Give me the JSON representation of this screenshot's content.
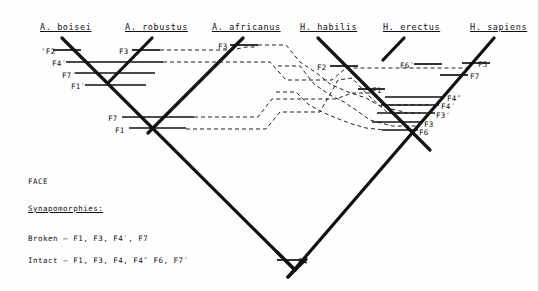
{
  "figure": {
    "type": "cladogram",
    "caption_region": "FACE",
    "taxa": [
      {
        "id": "a-boisei",
        "label": "A. boisei",
        "x": 40,
        "y": 22
      },
      {
        "id": "a-robustus",
        "label": "A. robustus",
        "x": 125,
        "y": 22
      },
      {
        "id": "a-africanus",
        "label": "A. africanus",
        "x": 212,
        "y": 22
      },
      {
        "id": "h-habilis",
        "label": "H. habilis",
        "x": 300,
        "y": 22
      },
      {
        "id": "h-erectus",
        "label": "H. erectus",
        "x": 383,
        "y": 22
      },
      {
        "id": "h-sapiens",
        "label": "H. sapiens",
        "x": 470,
        "y": 22
      }
    ],
    "character_labels": [
      {
        "id": "c-f2p",
        "text": "'F2",
        "x": 41,
        "y": 47
      },
      {
        "id": "c-f4p",
        "text": "F4′",
        "x": 52,
        "y": 59
      },
      {
        "id": "c-f7p",
        "text": "F7′",
        "x": 62,
        "y": 71
      },
      {
        "id": "c-f1p",
        "text": "F1′",
        "x": 71,
        "y": 82
      },
      {
        "id": "c-f3a",
        "text": "F3",
        "x": 119,
        "y": 47
      },
      {
        "id": "c-f3b",
        "text": "F3",
        "x": 218,
        "y": 42
      },
      {
        "id": "c-f7",
        "text": "F7",
        "x": 108,
        "y": 114
      },
      {
        "id": "c-f1a",
        "text": "F1",
        "x": 115,
        "y": 126
      },
      {
        "id": "c-f2",
        "text": "F2",
        "x": 317,
        "y": 63
      },
      {
        "id": "c-f1b",
        "text": "F1",
        "x": 372,
        "y": 86
      },
      {
        "id": "c-f6p",
        "text": "F6′",
        "x": 400,
        "y": 61
      },
      {
        "id": "c-f5",
        "text": "F5",
        "x": 478,
        "y": 60
      },
      {
        "id": "c-f7b",
        "text": "F7",
        "x": 470,
        "y": 72
      },
      {
        "id": "c-f4pp",
        "text": "F4″",
        "x": 447,
        "y": 94
      },
      {
        "id": "c-f4p2",
        "text": "F4′",
        "x": 441,
        "y": 102
      },
      {
        "id": "c-f3p",
        "text": "F3′",
        "x": 436,
        "y": 111
      },
      {
        "id": "c-f3c",
        "text": "F3",
        "x": 424,
        "y": 120
      },
      {
        "id": "c-f6",
        "text": "F6",
        "x": 419,
        "y": 128
      },
      {
        "id": "c-f4root",
        "text": "F4",
        "x": 298,
        "y": 257
      }
    ],
    "notes": [
      {
        "id": "note-face",
        "text": "FACE",
        "x": 28,
        "y": 177,
        "underline": false
      },
      {
        "id": "note-synapomorphies",
        "text": "Synapomorphies:",
        "x": 28,
        "y": 204,
        "underline": true
      },
      {
        "id": "note-broken",
        "text": "Broken — F1, F3, F4′, F7",
        "x": 28,
        "y": 234,
        "underline": false
      },
      {
        "id": "note-intact",
        "text": "Intact — F1, F3, F4, F4″ F6, F7′",
        "x": 28,
        "y": 256,
        "underline": false
      }
    ],
    "colors": {
      "ink": "#111111",
      "dashed": "#222222",
      "background": "#ffffff"
    },
    "tree_branches": [
      {
        "id": "b-boisei",
        "x1": 62,
        "y1": 38,
        "x2": 295,
        "y2": 270
      },
      {
        "id": "b-robustus",
        "x1": 152,
        "y1": 38,
        "x2": 108,
        "y2": 83
      },
      {
        "id": "b-africanus",
        "x1": 243,
        "y1": 38,
        "x2": 148,
        "y2": 133
      },
      {
        "id": "b-habilis",
        "x1": 318,
        "y1": 38,
        "x2": 430,
        "y2": 150
      },
      {
        "id": "b-erectus",
        "x1": 404,
        "y1": 38,
        "x2": 383,
        "y2": 60
      },
      {
        "id": "b-sapiens",
        "x1": 494,
        "y1": 38,
        "x2": 288,
        "y2": 277
      },
      {
        "id": "b-root-left",
        "x1": 295,
        "y1": 270,
        "x2": 277,
        "y2": 252
      },
      {
        "id": "b-root-right",
        "x1": 288,
        "y1": 277,
        "x2": 306,
        "y2": 259
      }
    ],
    "tick_bars": [
      {
        "id": "t-f2p",
        "x1": 53,
        "y1": 50,
        "x2": 81,
        "y2": 50
      },
      {
        "id": "t-f4p",
        "x1": 66,
        "y1": 62,
        "x2": 163,
        "y2": 62
      },
      {
        "id": "t-f7p",
        "x1": 75,
        "y1": 73,
        "x2": 155,
        "y2": 73
      },
      {
        "id": "t-f1p",
        "x1": 85,
        "y1": 85,
        "x2": 146,
        "y2": 85
      },
      {
        "id": "t-f3a",
        "x1": 132,
        "y1": 50,
        "x2": 160,
        "y2": 50
      },
      {
        "id": "t-f3b",
        "x1": 230,
        "y1": 45,
        "x2": 258,
        "y2": 45
      },
      {
        "id": "t-f7",
        "x1": 122,
        "y1": 117,
        "x2": 194,
        "y2": 117
      },
      {
        "id": "t-f1a",
        "x1": 129,
        "y1": 128,
        "x2": 186,
        "y2": 128
      },
      {
        "id": "t-f2",
        "x1": 330,
        "y1": 66,
        "x2": 358,
        "y2": 66
      },
      {
        "id": "t-f1b",
        "x1": 358,
        "y1": 89,
        "x2": 385,
        "y2": 89
      },
      {
        "id": "t-f6p",
        "x1": 414,
        "y1": 64,
        "x2": 442,
        "y2": 64
      },
      {
        "id": "t-f5",
        "x1": 462,
        "y1": 63,
        "x2": 490,
        "y2": 63
      },
      {
        "id": "t-f7b",
        "x1": 440,
        "y1": 75,
        "x2": 468,
        "y2": 75
      },
      {
        "id": "t-f4pp",
        "x1": 385,
        "y1": 97,
        "x2": 443,
        "y2": 97
      },
      {
        "id": "t-f4p2",
        "x1": 381,
        "y1": 105,
        "x2": 439,
        "y2": 105
      },
      {
        "id": "t-f3p",
        "x1": 377,
        "y1": 113,
        "x2": 435,
        "y2": 113
      },
      {
        "id": "t-f3c",
        "x1": 372,
        "y1": 122,
        "x2": 423,
        "y2": 122
      },
      {
        "id": "t-f6",
        "x1": 382,
        "y1": 130,
        "x2": 418,
        "y2": 130
      },
      {
        "id": "t-f4root",
        "x1": 277,
        "y1": 260,
        "x2": 305,
        "y2": 260
      }
    ],
    "dashed_paths": [
      {
        "id": "d-1",
        "points": "160,50 232,50 246,47 258,47"
      },
      {
        "id": "d-2",
        "points": "163,62 270,62 286,80 332,80 346,68 414,68 470,68"
      },
      {
        "id": "d-3",
        "points": "194,117 258,117 272,99 336,99 352,93 372,93 386,105 430,105"
      },
      {
        "id": "d-4",
        "points": "186,129 266,129 280,112 320,112 338,80 352,78 368,95 388,113 420,113"
      },
      {
        "id": "d-5",
        "points": "258,45 286,45 300,62 318,74 330,84 348,92 366,98 380,106 404,112"
      },
      {
        "id": "d-6",
        "points": "278,66 300,66 314,84 330,95 344,102 356,110 370,120 392,126 418,126"
      },
      {
        "id": "d-7",
        "points": "276,92 296,92 308,104 322,112 336,118 352,124 366,128 384,130"
      }
    ]
  }
}
